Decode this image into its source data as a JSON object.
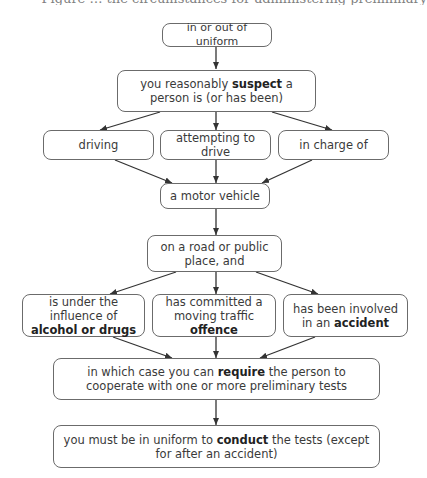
{
  "caption": "Figure … the circumstances for administering preliminary",
  "nodes": {
    "uniform_status": {
      "text": "in or out of uniform"
    },
    "suspect": {
      "pre": "you reasonably ",
      "bold": "suspect",
      "post": " a person is (or has been)"
    },
    "driving": {
      "text": "driving"
    },
    "attempting": {
      "text": "attempting to drive"
    },
    "in_charge": {
      "text": "in charge of"
    },
    "motor_vehicle": {
      "text": "a motor vehicle"
    },
    "road": {
      "text": "on a road or public place, and"
    },
    "influence": {
      "pre": "is under the influence of ",
      "bold": "alcohol or drugs",
      "post": ""
    },
    "offence": {
      "pre": "has committed a moving traffic ",
      "bold": "offence",
      "post": ""
    },
    "accident": {
      "pre": "has been involved in an ",
      "bold": "accident",
      "post": ""
    },
    "require": {
      "pre": "in which case you can ",
      "bold": "require",
      "post": " the person to cooperate with one or more preliminary tests"
    },
    "conduct": {
      "pre": "you must be in uniform to ",
      "bold": "conduct",
      "post": " the tests (except for after an accident)"
    }
  },
  "edges": [
    [
      "uniform_status",
      "suspect"
    ],
    [
      "suspect",
      "driving"
    ],
    [
      "suspect",
      "attempting"
    ],
    [
      "suspect",
      "in_charge"
    ],
    [
      "driving",
      "motor_vehicle"
    ],
    [
      "attempting",
      "motor_vehicle"
    ],
    [
      "in_charge",
      "motor_vehicle"
    ],
    [
      "motor_vehicle",
      "road"
    ],
    [
      "road",
      "influence"
    ],
    [
      "road",
      "offence"
    ],
    [
      "road",
      "accident"
    ],
    [
      "influence",
      "require"
    ],
    [
      "offence",
      "require"
    ],
    [
      "accident",
      "require"
    ],
    [
      "require",
      "conduct"
    ]
  ],
  "colors": {
    "line": "#333333",
    "border": "#6b6b6b",
    "text": "#3a3a3a"
  }
}
